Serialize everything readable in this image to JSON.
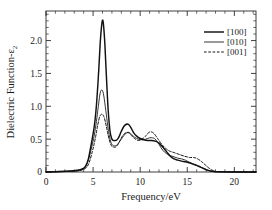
{
  "chart_data": {
    "type": "line",
    "title": "",
    "xlabel": "Frequency/eV",
    "ylabel": "Dielectric Function-ε",
    "ylabel_subscript": "2",
    "xlim": [
      0,
      22.3
    ],
    "ylim": [
      0,
      2.45
    ],
    "xticks": [
      0,
      5,
      10,
      15,
      20
    ],
    "xticklabels": [
      "0",
      "5",
      "10",
      "15",
      "20"
    ],
    "yticks": [
      0,
      0.5,
      1.0,
      1.5,
      2.0
    ],
    "yticklabels": [
      "0",
      "0.5",
      "1.0",
      "1.5",
      "2.0"
    ],
    "xminor_step": 1,
    "yminor_step": 0.1,
    "grid": false,
    "legend_position": "top-right",
    "frame": "box",
    "series": [
      {
        "name": "[100]",
        "style": "solid-thick",
        "color": "#111111",
        "x": [
          0.0,
          1.0,
          2.0,
          3.0,
          3.5,
          3.9,
          4.2,
          4.5,
          4.8,
          5.0,
          5.2,
          5.4,
          5.6,
          5.75,
          5.9,
          6.0,
          6.1,
          6.25,
          6.4,
          6.6,
          6.8,
          7.0,
          7.2,
          7.4,
          7.6,
          7.8,
          8.0,
          8.3,
          8.6,
          8.8,
          9.0,
          9.3,
          9.6,
          10.0,
          10.4,
          10.8,
          11.2,
          11.6,
          12.0,
          12.4,
          12.8,
          13.2,
          13.6,
          14.0,
          14.4,
          14.8,
          15.2,
          15.6,
          16.0,
          16.4,
          16.8,
          17.2,
          17.6,
          18.0,
          19.0,
          20.0,
          21.0,
          22.3
        ],
        "y": [
          0.0,
          0.005,
          0.01,
          0.02,
          0.03,
          0.05,
          0.09,
          0.2,
          0.42,
          0.58,
          0.78,
          1.1,
          1.55,
          1.95,
          2.22,
          2.31,
          2.25,
          1.95,
          1.5,
          0.95,
          0.62,
          0.5,
          0.48,
          0.48,
          0.5,
          0.55,
          0.62,
          0.7,
          0.73,
          0.72,
          0.68,
          0.6,
          0.55,
          0.51,
          0.49,
          0.48,
          0.48,
          0.47,
          0.44,
          0.38,
          0.31,
          0.24,
          0.2,
          0.18,
          0.165,
          0.155,
          0.14,
          0.12,
          0.1,
          0.075,
          0.05,
          0.025,
          0.012,
          0.005,
          0.002,
          0.001,
          0.0,
          0.0
        ]
      },
      {
        "name": "[010]",
        "style": "solid-thin",
        "color": "#111111",
        "x": [
          0.0,
          1.0,
          2.0,
          3.0,
          3.5,
          3.9,
          4.2,
          4.5,
          4.8,
          5.0,
          5.2,
          5.4,
          5.6,
          5.75,
          5.9,
          6.05,
          6.2,
          6.4,
          6.6,
          6.8,
          7.0,
          7.2,
          7.4,
          7.6,
          7.8,
          8.0,
          8.3,
          8.6,
          8.85,
          9.1,
          9.4,
          9.8,
          10.2,
          10.6,
          11.0,
          11.3,
          11.6,
          12.0,
          12.4,
          12.8,
          13.2,
          13.6,
          14.0,
          14.4,
          14.8,
          15.2,
          15.6,
          16.0,
          16.4,
          16.8,
          17.2,
          17.6,
          18.0,
          19.0,
          20.0,
          21.0,
          22.3
        ],
        "y": [
          0.0,
          0.004,
          0.008,
          0.015,
          0.025,
          0.04,
          0.08,
          0.18,
          0.35,
          0.47,
          0.62,
          0.82,
          1.05,
          1.2,
          1.25,
          1.22,
          1.1,
          0.88,
          0.66,
          0.5,
          0.42,
          0.4,
          0.4,
          0.42,
          0.46,
          0.5,
          0.56,
          0.6,
          0.6,
          0.57,
          0.53,
          0.5,
          0.49,
          0.5,
          0.52,
          0.52,
          0.5,
          0.42,
          0.33,
          0.28,
          0.25,
          0.23,
          0.21,
          0.2,
          0.18,
          0.15,
          0.125,
          0.1,
          0.075,
          0.05,
          0.028,
          0.013,
          0.005,
          0.002,
          0.001,
          0.0,
          0.0
        ]
      },
      {
        "name": "[001]",
        "style": "dotted",
        "color": "#111111",
        "x": [
          0.0,
          1.0,
          2.0,
          3.0,
          3.5,
          3.9,
          4.3,
          4.6,
          4.9,
          5.1,
          5.3,
          5.5,
          5.7,
          5.9,
          6.05,
          6.2,
          6.4,
          6.6,
          6.8,
          7.0,
          7.2,
          7.4,
          7.6,
          7.8,
          8.0,
          8.3,
          8.6,
          8.85,
          9.1,
          9.4,
          9.8,
          10.2,
          10.6,
          10.9,
          11.2,
          11.5,
          11.9,
          12.3,
          12.7,
          13.1,
          13.5,
          13.9,
          14.3,
          14.7,
          15.0,
          15.3,
          15.7,
          16.1,
          16.5,
          16.9,
          17.3,
          17.7,
          18.1,
          19.0,
          20.0,
          21.0,
          22.3
        ],
        "y": [
          0.0,
          0.003,
          0.006,
          0.012,
          0.02,
          0.035,
          0.07,
          0.15,
          0.3,
          0.42,
          0.56,
          0.72,
          0.84,
          0.88,
          0.87,
          0.82,
          0.7,
          0.56,
          0.45,
          0.39,
          0.38,
          0.38,
          0.41,
          0.46,
          0.52,
          0.58,
          0.6,
          0.59,
          0.55,
          0.51,
          0.48,
          0.5,
          0.55,
          0.6,
          0.61,
          0.58,
          0.5,
          0.42,
          0.36,
          0.32,
          0.3,
          0.28,
          0.26,
          0.24,
          0.23,
          0.22,
          0.22,
          0.2,
          0.16,
          0.11,
          0.06,
          0.025,
          0.008,
          0.002,
          0.001,
          0.0,
          0.0
        ]
      }
    ]
  },
  "legend": {
    "items": [
      {
        "label": "[100]",
        "style": "solid-thick"
      },
      {
        "label": "[010]",
        "style": "solid-thin"
      },
      {
        "label": "[001]",
        "style": "dotted"
      }
    ]
  },
  "axes": {
    "x_title": "Frequency/eV",
    "y_title_main": "Dielectric Function-ε",
    "y_title_sub": "2",
    "x_tick_0": "0",
    "x_tick_1": "5",
    "x_tick_2": "10",
    "x_tick_3": "15",
    "x_tick_4": "20",
    "y_tick_0": "0",
    "y_tick_1": "0.5",
    "y_tick_2": "1.0",
    "y_tick_3": "1.5",
    "y_tick_4": "2.0"
  },
  "colors": {
    "background": "#ffffff",
    "ink": "#111111",
    "axis": "#2a2a2a"
  }
}
